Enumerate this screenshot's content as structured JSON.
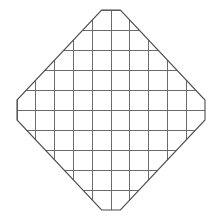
{
  "figure": {
    "background_color": "#ffffff",
    "grid_line_color": "#6b6b6b",
    "outline_color": "#4d4d4d",
    "grid_line_width": 1,
    "outline_width": 1.1
  },
  "chart_data": {
    "type": "diagram",
    "xlabel": "",
    "ylabel": "",
    "grid": {
      "columns": 10,
      "rows": 10,
      "cell_width": 18.8,
      "cell_height": 20.0,
      "origin_x": 17,
      "origin_y": 10,
      "width": 188,
      "height": 200,
      "vertical_line_positions": [
        17,
        35.8,
        54.6,
        73.4,
        92.2,
        111,
        129.8,
        148.6,
        167.4,
        186.2,
        205
      ],
      "horizontal_line_positions": [
        10,
        30,
        50,
        70,
        90,
        110,
        130,
        150,
        170,
        190,
        210
      ]
    },
    "octagon": {
      "sides": 8,
      "description": "Corners of the 10x10 grid square are cut by 45-degree diagonals spanning 4.5 cells, leaving 1-cell flat edges at top, bottom, left and right extremes.",
      "vertices_in_cell_units": [
        [
          4.5,
          0.0
        ],
        [
          5.5,
          0.0
        ],
        [
          10.0,
          4.5
        ],
        [
          10.0,
          5.5
        ],
        [
          5.5,
          10.0
        ],
        [
          4.5,
          10.0
        ],
        [
          0.0,
          5.5
        ],
        [
          0.0,
          4.5
        ]
      ],
      "vertices_in_pixels": [
        [
          101.6,
          10
        ],
        [
          120.4,
          10
        ],
        [
          205,
          100
        ],
        [
          205,
          120
        ],
        [
          120.4,
          210
        ],
        [
          101.6,
          210
        ],
        [
          17,
          120
        ],
        [
          17,
          100
        ]
      ],
      "flat_edge_lengths_in_cells": {
        "top": 1,
        "bottom": 1,
        "left": 1,
        "right": 1
      },
      "diagonal_span_in_cells": 4.5
    },
    "legend": [],
    "annotations": []
  }
}
